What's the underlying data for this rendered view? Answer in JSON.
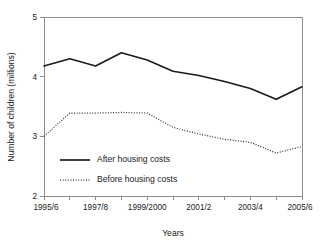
{
  "chart_data": {
    "type": "line",
    "title": "",
    "xlabel": "Years",
    "ylabel": "Number of children (millions)",
    "ylim": [
      2,
      5
    ],
    "xlim": [
      0,
      10
    ],
    "grid": false,
    "legend_position": "inside-lower-left",
    "y_ticks": [
      "2",
      "3",
      "4",
      "5"
    ],
    "y_tick_values": [
      2,
      3,
      4,
      5
    ],
    "categories": [
      "1995/6",
      "1996/7",
      "1997/8",
      "1998/9",
      "1999/2000",
      "2000/1",
      "2001/2",
      "2002/3",
      "2003/4",
      "2004/5",
      "2005/6"
    ],
    "x_tick_labels": [
      "1995/6",
      "",
      "1997/8",
      "",
      "1999/2000",
      "",
      "2001/2",
      "",
      "2003/4",
      "",
      "2005/6"
    ],
    "series": [
      {
        "name": "After housing costs",
        "style": "solid",
        "color": "#1a1a1a",
        "values": [
          4.18,
          4.3,
          4.18,
          4.4,
          4.28,
          4.09,
          4.02,
          3.92,
          3.8,
          3.62,
          3.83
        ]
      },
      {
        "name": "Before housing costs",
        "style": "dotted",
        "color": "#333333",
        "values": [
          3.0,
          3.39,
          3.39,
          3.4,
          3.39,
          3.15,
          3.04,
          2.95,
          2.9,
          2.72,
          2.83
        ]
      }
    ]
  },
  "legend": {
    "items": [
      {
        "label": "After housing costs",
        "style": "solid"
      },
      {
        "label": "Before housing costs",
        "style": "dotted"
      }
    ]
  },
  "axes": {
    "x_title": "Years",
    "y_title": "Number of children (millions)"
  }
}
